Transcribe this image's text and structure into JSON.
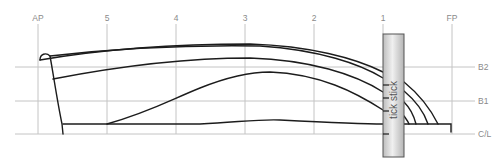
{
  "diagram": {
    "stations": [
      {
        "label": "AP",
        "x": 38
      },
      {
        "label": "5",
        "x": 107
      },
      {
        "label": "4",
        "x": 176
      },
      {
        "label": "3",
        "x": 245
      },
      {
        "label": "2",
        "x": 314
      },
      {
        "label": "1",
        "x": 383
      },
      {
        "label": "FP",
        "x": 452
      }
    ],
    "buttocks": [
      {
        "label": "B2",
        "y": 67
      },
      {
        "label": "B1",
        "y": 101
      },
      {
        "label": "C/L",
        "y": 134
      }
    ],
    "tick_stick": {
      "label": "tick stick",
      "x": 383,
      "y": 34,
      "width": 21,
      "height": 123
    },
    "colors": {
      "grid": "#c4c4c4",
      "hull": "#1c1c1c",
      "label": "#8a8a8a",
      "stick_fill_light": "#ececec",
      "stick_fill_dark": "#b8b8b8",
      "stick_border": "#555555"
    }
  }
}
